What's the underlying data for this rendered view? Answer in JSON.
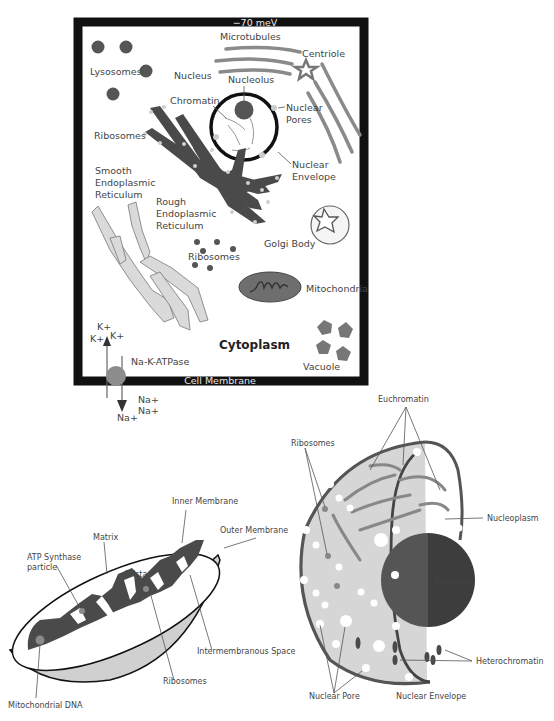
{
  "cell": {
    "membrane_potential": "−70 meV",
    "cell_membrane": "Cell Membrane",
    "labels": {
      "lysosomes": "Lysosomes",
      "microtubules": "Microtubules",
      "centriole": "Centriole",
      "nucleus": "Nucleus",
      "nucleolus": "Nucleolus",
      "chromatin": "Chromatin",
      "nuclear_pores_1": "Nuclear",
      "nuclear_pores_2": "Pores",
      "ribosomes_top": "Ribosomes",
      "nuclear_envelope_1": "Nuclear",
      "nuclear_envelope_2": "Envelope",
      "smooth_er_1": "Smooth",
      "smooth_er_2": "Endoplasmic",
      "smooth_er_3": "Reticulum",
      "rough_er_1": "Rough",
      "rough_er_2": "Endoplasmic",
      "rough_er_3": "Reticulum",
      "golgi": "Golgi Body",
      "ribosomes_free": "Ribosomes",
      "mitochondria": "Mitochondria",
      "cytoplasm": "Cytoplasm",
      "vacuole": "Vacuole",
      "pump": "Na-K-ATPase"
    },
    "ions": {
      "k": [
        "K+",
        "K+",
        "K+"
      ],
      "na": [
        "Na+",
        "Na+",
        "Na+"
      ]
    }
  },
  "mitochondrion": {
    "labels": {
      "inner_membrane": "Inner Membrane",
      "outer_membrane": "Outer Membrane",
      "matrix": "Matrix",
      "atp_synthase_1": "ATP Synthase",
      "atp_synthase_2": "particle",
      "crista": "Crista",
      "intermembranous_space": "Intermembranous Space",
      "ribosomes": "Ribosomes",
      "mito_dna": "Mitochondrial DNA"
    }
  },
  "nucleus": {
    "labels": {
      "euchromatin": "Euchromatin",
      "ribosomes": "Ribosomes",
      "nucleoplasm": "Nucleoplasm",
      "nucleolus": "Nucleolus",
      "heterochromatin": "Heterochromatin",
      "nuclear_pore": "Nuclear Pore",
      "nuclear_envelope": "Nuclear Envelope"
    }
  },
  "colors": {
    "frame": "#111111",
    "dark_organelle": "#4a4a4a",
    "mid_gray": "#7a7a7a",
    "light_gray": "#d4d4d4",
    "pale": "#eeeeee"
  }
}
